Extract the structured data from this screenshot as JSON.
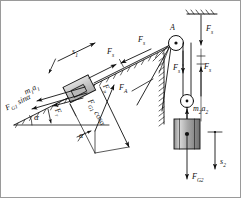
{
  "figure": {
    "background": "#ffffff",
    "border_color": "#9a9a9a",
    "line_color": "#111111",
    "block_fill": "#c9c9c9",
    "cylinder_fill": "#b4b4b4"
  },
  "labels": {
    "pulley_a": "A",
    "rope_force_incline_left": "F",
    "rope_force_incline_left_sub": "s",
    "rope_force_incline_right": "F",
    "rope_force_incline_right_sub": "s",
    "displacement_incline": "s",
    "displacement_incline_sub": "1",
    "inertia_block": "m",
    "inertia_block_sub1": "1",
    "inertia_block_a": "a",
    "inertia_block_sub2": "1",
    "gravity_parallel": "F",
    "gravity_parallel_sub": "G1",
    "gravity_parallel_trig": "sin",
    "gravity_parallel_angle": "α",
    "friction": "F",
    "friction_sub": "r",
    "normal": "F",
    "normal_sub": "n",
    "gravity_perp": "F",
    "gravity_perp_sub": "G1",
    "gravity_perp_trig": "cos",
    "gravity_perp_angle": "α",
    "incline_angle": "α",
    "parallelogram_angle": "α",
    "support_force": "F",
    "support_force_sub": "A",
    "ceiling_force": "F",
    "ceiling_force_sub": "s",
    "strand_left": "F",
    "strand_left_sub": "s",
    "strand_right": "F",
    "strand_right_sub": "s",
    "inertia_hanging": "m",
    "inertia_hanging_sub1": "2",
    "inertia_hanging_a": "a",
    "inertia_hanging_sub2": "2",
    "weight_hanging": "F",
    "weight_hanging_sub": "G2",
    "displacement_hanging": "s",
    "displacement_hanging_sub": "2"
  },
  "elements": {
    "incline_surface": "hatched inclined plane rising left to right",
    "ceiling": "hatched fixed ceiling support",
    "wall": "hatched vertical wall",
    "fixed_pulley": "fixed pulley at point A",
    "movable_pulley": "movable pulley carrying the hanging mass",
    "sliding_block": "block of mass m1 on incline",
    "hanging_cylinder": "cylindrical mass m2"
  }
}
